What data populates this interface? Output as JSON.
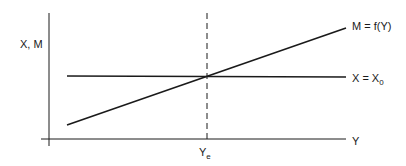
{
  "diagram": {
    "axes": {
      "y_axis_label": "X, M",
      "x_axis_label": "Y"
    },
    "lines": {
      "import_function": {
        "label": "M = f(Y)"
      },
      "exports": {
        "label_main": "X = X",
        "label_sub": "0"
      }
    },
    "equilibrium": {
      "label_main": "Y",
      "label_sub": "e"
    },
    "colors": {
      "line": "#1a1a1a",
      "background": "#ffffff"
    }
  }
}
